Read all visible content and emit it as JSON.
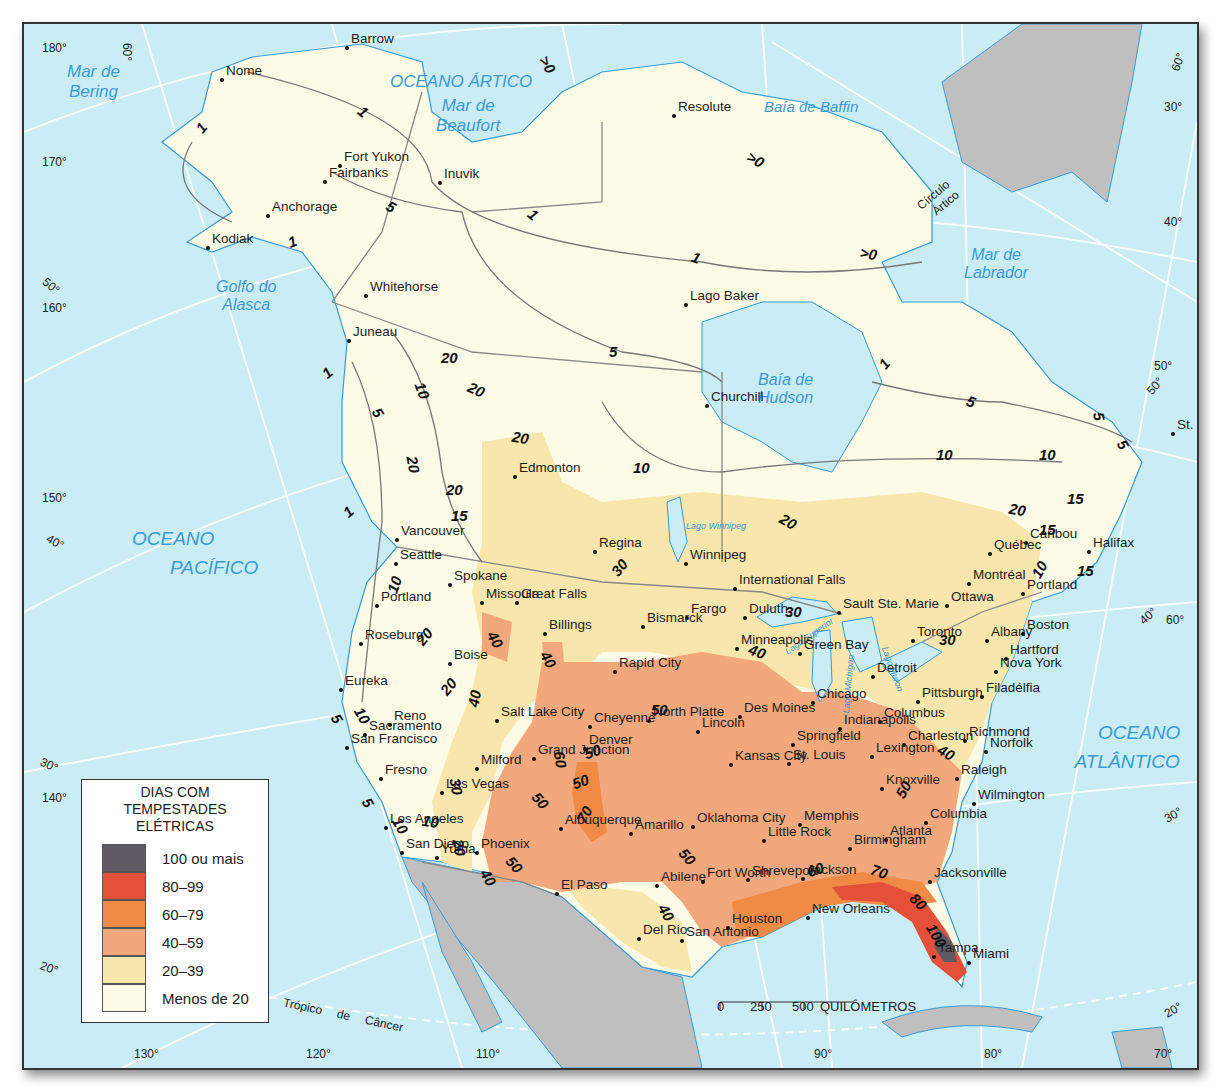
{
  "legend": {
    "title_lines": [
      "DIAS COM",
      "TEMPESTADES",
      "ELÉTRICAS"
    ],
    "classes": [
      {
        "label": "100 ou mais",
        "color": "#5d5a63"
      },
      {
        "label": "80–99",
        "color": "#e5503b"
      },
      {
        "label": "60–79",
        "color": "#f08a44"
      },
      {
        "label": "40–59",
        "color": "#f2a77c"
      },
      {
        "label": "20–39",
        "color": "#f8e6ad"
      },
      {
        "label": "Menos de 20",
        "color": "#fdfbe6"
      }
    ]
  },
  "scale_bar": {
    "ticks": [
      "0",
      "250",
      "500"
    ],
    "unit": "QUILÔMETROS"
  },
  "water_labels": {
    "bering": [
      "Mar de",
      "Bering"
    ],
    "arctic": "OCEANO ÁRTICO",
    "beaufort": [
      "Mar de",
      "Beaufort"
    ],
    "baffin": "Baía de Baffin",
    "labrador": [
      "Mar de",
      "Labrador"
    ],
    "alaska_gulf": [
      "Golfo do",
      "Alasca"
    ],
    "hudson": [
      "Baía de",
      "Hudson"
    ],
    "pacific": [
      "OCEANO",
      "PACÍFICO"
    ],
    "atlantic": [
      "OCEANO",
      "ATLÂNTICO"
    ],
    "lake_winnipeg": "Lago Winnipeg",
    "lake_superior": "Lago Superior",
    "lake_michigan": "Lago Michigan",
    "lake_huron": "Lago Huron"
  },
  "reference_lines": {
    "arctic_circle": [
      "Círculo",
      "Ártico"
    ],
    "tropic": "Trópico de Câncer"
  },
  "graticule": {
    "left": [
      "180°",
      "170°",
      "160°",
      "150°",
      "140°"
    ],
    "left_lat": [
      "60°",
      "50°",
      "40°",
      "30°",
      "20°"
    ],
    "bottom": [
      "130°",
      "120°",
      "110°",
      "90°",
      "80°",
      "70°"
    ],
    "right": [
      "60°",
      "30°",
      "40°",
      "50°",
      "50°",
      "40°",
      "60°",
      "30°",
      "20°"
    ]
  },
  "cities": [
    {
      "name": "Barrow",
      "x": 347,
      "y": 48
    },
    {
      "name": "Nome",
      "x": 222,
      "y": 80
    },
    {
      "name": "Fort Yukon",
      "x": 340,
      "y": 166
    },
    {
      "name": "Fairbanks",
      "x": 325,
      "y": 182
    },
    {
      "name": "Anchorage",
      "x": 268,
      "y": 216
    },
    {
      "name": "Kodiak",
      "x": 208,
      "y": 248
    },
    {
      "name": "Inuvik",
      "x": 440,
      "y": 183
    },
    {
      "name": "Resolute",
      "x": 674,
      "y": 116
    },
    {
      "name": "Whitehorse",
      "x": 366,
      "y": 296
    },
    {
      "name": "Juneau",
      "x": 349,
      "y": 341
    },
    {
      "name": "Lago Baker",
      "x": 686,
      "y": 305
    },
    {
      "name": "Churchill",
      "x": 707,
      "y": 406
    },
    {
      "name": "Edmonton",
      "x": 515,
      "y": 477
    },
    {
      "name": "St. John's",
      "x": 1173,
      "y": 434
    },
    {
      "name": "Vancouver",
      "x": 397,
      "y": 540
    },
    {
      "name": "Seattle",
      "x": 396,
      "y": 564
    },
    {
      "name": "Spokane",
      "x": 450,
      "y": 585
    },
    {
      "name": "Missoula",
      "x": 482,
      "y": 603
    },
    {
      "name": "Great Falls",
      "x": 517,
      "y": 603
    },
    {
      "name": "Regina",
      "x": 595,
      "y": 552
    },
    {
      "name": "Winnipeg",
      "x": 686,
      "y": 564
    },
    {
      "name": "International Falls",
      "x": 735,
      "y": 589
    },
    {
      "name": "Portland",
      "x": 377,
      "y": 606
    },
    {
      "name": "Roseburg",
      "x": 361,
      "y": 644
    },
    {
      "name": "Boise",
      "x": 450,
      "y": 664
    },
    {
      "name": "Billings",
      "x": 545,
      "y": 634
    },
    {
      "name": "Bismarck",
      "x": 643,
      "y": 627
    },
    {
      "name": "Fargo",
      "x": 687,
      "y": 618
    },
    {
      "name": "Duluth",
      "x": 745,
      "y": 618
    },
    {
      "name": "Minneapolis",
      "x": 737,
      "y": 649
    },
    {
      "name": "Green Bay",
      "x": 800,
      "y": 654
    },
    {
      "name": "Sault Ste. Marie",
      "x": 839,
      "y": 613
    },
    {
      "name": "Detroit",
      "x": 873,
      "y": 677
    },
    {
      "name": "Ottawa",
      "x": 947,
      "y": 606
    },
    {
      "name": "Toronto",
      "x": 913,
      "y": 641
    },
    {
      "name": "Albany",
      "x": 987,
      "y": 641
    },
    {
      "name": "Boston",
      "x": 1023,
      "y": 634
    },
    {
      "name": "Québec",
      "x": 990,
      "y": 554
    },
    {
      "name": "Caribou",
      "x": 1026,
      "y": 543
    },
    {
      "name": "Montréal",
      "x": 969,
      "y": 584
    },
    {
      "name": "Portland (ME)",
      "x": 1023,
      "y": 594
    },
    {
      "name": "Halifax",
      "x": 1089,
      "y": 552
    },
    {
      "name": "Hartford",
      "x": 1006,
      "y": 659
    },
    {
      "name": "Nova York",
      "x": 996,
      "y": 672
    },
    {
      "name": "Rapid City",
      "x": 615,
      "y": 672
    },
    {
      "name": "Eureka",
      "x": 341,
      "y": 690
    },
    {
      "name": "Sacramento",
      "x": 365,
      "y": 735
    },
    {
      "name": "San Francisco",
      "x": 347,
      "y": 748
    },
    {
      "name": "Reno",
      "x": 390,
      "y": 725
    },
    {
      "name": "Salt Lake City",
      "x": 497,
      "y": 721
    },
    {
      "name": "Cheyenne",
      "x": 590,
      "y": 727
    },
    {
      "name": "North Platte",
      "x": 649,
      "y": 721
    },
    {
      "name": "Lincoln",
      "x": 698,
      "y": 732
    },
    {
      "name": "Des Moines",
      "x": 740,
      "y": 717
    },
    {
      "name": "Chicago",
      "x": 813,
      "y": 703
    },
    {
      "name": "Indianapolis",
      "x": 840,
      "y": 729
    },
    {
      "name": "Columbus",
      "x": 880,
      "y": 722
    },
    {
      "name": "Pittsburgh",
      "x": 918,
      "y": 702
    },
    {
      "name": "Filadélfia",
      "x": 982,
      "y": 697
    },
    {
      "name": "Richmond",
      "x": 965,
      "y": 741
    },
    {
      "name": "Norfolk",
      "x": 986,
      "y": 752
    },
    {
      "name": "Milford",
      "x": 477,
      "y": 769
    },
    {
      "name": "Denver",
      "x": 585,
      "y": 749
    },
    {
      "name": "Grand Junction",
      "x": 534,
      "y": 759
    },
    {
      "name": "Kansas City",
      "x": 731,
      "y": 765
    },
    {
      "name": "Springfield",
      "x": 793,
      "y": 745
    },
    {
      "name": "St. Louis",
      "x": 789,
      "y": 764
    },
    {
      "name": "Charleston",
      "x": 904,
      "y": 745
    },
    {
      "name": "Lexington",
      "x": 872,
      "y": 757
    },
    {
      "name": "Raleigh",
      "x": 957,
      "y": 779
    },
    {
      "name": "Fresno",
      "x": 381,
      "y": 779
    },
    {
      "name": "Las Vegas",
      "x": 442,
      "y": 793
    },
    {
      "name": "Knoxville",
      "x": 882,
      "y": 789
    },
    {
      "name": "Wilmington",
      "x": 974,
      "y": 804
    },
    {
      "name": "Albuquerque",
      "x": 561,
      "y": 829
    },
    {
      "name": "Oklahoma City",
      "x": 693,
      "y": 827
    },
    {
      "name": "Little Rock",
      "x": 764,
      "y": 841
    },
    {
      "name": "Memphis",
      "x": 800,
      "y": 825
    },
    {
      "name": "Atlanta",
      "x": 886,
      "y": 840
    },
    {
      "name": "Columbia",
      "x": 926,
      "y": 823
    },
    {
      "name": "Los Angeles",
      "x": 386,
      "y": 828
    },
    {
      "name": "San Diego",
      "x": 402,
      "y": 853
    },
    {
      "name": "Yuma",
      "x": 437,
      "y": 858
    },
    {
      "name": "Phoenix",
      "x": 477,
      "y": 853
    },
    {
      "name": "Amarillo",
      "x": 631,
      "y": 834
    },
    {
      "name": "Birmingham",
      "x": 850,
      "y": 849
    },
    {
      "name": "Jackson",
      "x": 803,
      "y": 879
    },
    {
      "name": "Shreveport",
      "x": 748,
      "y": 880
    },
    {
      "name": "Abilene",
      "x": 657,
      "y": 886
    },
    {
      "name": "Fort Worth",
      "x": 703,
      "y": 882
    },
    {
      "name": "Jacksonville",
      "x": 930,
      "y": 882
    },
    {
      "name": "El Paso",
      "x": 557,
      "y": 894
    },
    {
      "name": "New Orleans",
      "x": 808,
      "y": 918
    },
    {
      "name": "Houston",
      "x": 728,
      "y": 928
    },
    {
      "name": "Del Rio",
      "x": 639,
      "y": 939
    },
    {
      "name": "San Antonio",
      "x": 682,
      "y": 941
    },
    {
      "name": "Tampa",
      "x": 934,
      "y": 957
    },
    {
      "name": "Miami",
      "x": 969,
      "y": 963
    }
  ],
  "isolines": [
    {
      "value": "1",
      "x": 205,
      "y": 128,
      "rot": -50
    },
    {
      "value": "1",
      "x": 367,
      "y": 112,
      "rot": 40
    },
    {
      "value": "5",
      "x": 395,
      "y": 207,
      "rot": 30
    },
    {
      "value": "1",
      "x": 296,
      "y": 242,
      "rot": -20
    },
    {
      "value": "1",
      "x": 537,
      "y": 215,
      "rot": 40
    },
    {
      "value": ">0",
      "x": 547,
      "y": 65,
      "rot": 60
    },
    {
      "value": ">0",
      "x": 755,
      "y": 160,
      "rot": 30
    },
    {
      "value": ">0",
      "x": 868,
      "y": 254,
      "rot": 10
    },
    {
      "value": "1",
      "x": 700,
      "y": 258,
      "rot": 20
    },
    {
      "value": "5",
      "x": 617,
      "y": 352,
      "rot": 0
    },
    {
      "value": "20",
      "x": 449,
      "y": 358,
      "rot": 0
    },
    {
      "value": "20",
      "x": 476,
      "y": 390,
      "rot": 25
    },
    {
      "value": "10",
      "x": 422,
      "y": 391,
      "rot": 70
    },
    {
      "value": "5",
      "x": 382,
      "y": 413,
      "rot": 60
    },
    {
      "value": "1",
      "x": 331,
      "y": 373,
      "rot": -40
    },
    {
      "value": "20",
      "x": 520,
      "y": 438,
      "rot": 10
    },
    {
      "value": "20",
      "x": 413,
      "y": 465,
      "rot": 80
    },
    {
      "value": "20",
      "x": 454,
      "y": 490,
      "rot": 0
    },
    {
      "value": "15",
      "x": 459,
      "y": 516,
      "rot": 0
    },
    {
      "value": "10",
      "x": 641,
      "y": 468,
      "rot": 0
    },
    {
      "value": "1",
      "x": 888,
      "y": 364,
      "rot": -50
    },
    {
      "value": "5",
      "x": 975,
      "y": 402,
      "rot": 20
    },
    {
      "value": "10",
      "x": 944,
      "y": 455,
      "rot": 0
    },
    {
      "value": "10",
      "x": 1047,
      "y": 455,
      "rot": 0
    },
    {
      "value": "5",
      "x": 1103,
      "y": 417,
      "rot": 80
    },
    {
      "value": "5",
      "x": 1127,
      "y": 445,
      "rot": 60
    },
    {
      "value": "15",
      "x": 1075,
      "y": 499,
      "rot": 0
    },
    {
      "value": "20",
      "x": 1017,
      "y": 510,
      "rot": 10
    },
    {
      "value": "15",
      "x": 1047,
      "y": 530,
      "rot": 0
    },
    {
      "value": "15",
      "x": 1085,
      "y": 571,
      "rot": 0
    },
    {
      "value": "10",
      "x": 1039,
      "y": 570,
      "rot": -60
    },
    {
      "value": "20",
      "x": 788,
      "y": 522,
      "rot": 30
    },
    {
      "value": "30",
      "x": 619,
      "y": 568,
      "rot": -50
    },
    {
      "value": "1",
      "x": 352,
      "y": 512,
      "rot": -40
    },
    {
      "value": "10",
      "x": 394,
      "y": 585,
      "rot": -70
    },
    {
      "value": "30",
      "x": 793,
      "y": 612,
      "rot": 0
    },
    {
      "value": "30",
      "x": 947,
      "y": 640,
      "rot": 0
    },
    {
      "value": "40",
      "x": 757,
      "y": 652,
      "rot": 20
    },
    {
      "value": "20",
      "x": 424,
      "y": 637,
      "rot": -50
    },
    {
      "value": "40",
      "x": 495,
      "y": 640,
      "rot": 60
    },
    {
      "value": "40",
      "x": 548,
      "y": 660,
      "rot": 60
    },
    {
      "value": "20",
      "x": 448,
      "y": 687,
      "rot": -50
    },
    {
      "value": "40",
      "x": 474,
      "y": 699,
      "rot": -80
    },
    {
      "value": "50",
      "x": 659,
      "y": 710,
      "rot": 0
    },
    {
      "value": "5",
      "x": 341,
      "y": 719,
      "rot": 60
    },
    {
      "value": "10",
      "x": 362,
      "y": 716,
      "rot": 60
    },
    {
      "value": "40",
      "x": 946,
      "y": 753,
      "rot": 30
    },
    {
      "value": "60",
      "x": 560,
      "y": 760,
      "rot": 80
    },
    {
      "value": "50",
      "x": 592,
      "y": 752,
      "rot": -20
    },
    {
      "value": "50",
      "x": 580,
      "y": 782,
      "rot": -20
    },
    {
      "value": "30",
      "x": 456,
      "y": 787,
      "rot": 80
    },
    {
      "value": "50",
      "x": 540,
      "y": 801,
      "rot": 50
    },
    {
      "value": "70",
      "x": 584,
      "y": 815,
      "rot": -60
    },
    {
      "value": "50",
      "x": 903,
      "y": 790,
      "rot": -60
    },
    {
      "value": "5",
      "x": 372,
      "y": 803,
      "rot": 60
    },
    {
      "value": "10",
      "x": 400,
      "y": 826,
      "rot": 60
    },
    {
      "value": "10",
      "x": 430,
      "y": 822,
      "rot": 10
    },
    {
      "value": "20",
      "x": 459,
      "y": 848,
      "rot": 80
    },
    {
      "value": "50",
      "x": 514,
      "y": 865,
      "rot": 50
    },
    {
      "value": "50",
      "x": 687,
      "y": 857,
      "rot": 50
    },
    {
      "value": "40",
      "x": 488,
      "y": 878,
      "rot": 60
    },
    {
      "value": "60",
      "x": 815,
      "y": 870,
      "rot": -20
    },
    {
      "value": "70",
      "x": 879,
      "y": 872,
      "rot": 20
    },
    {
      "value": "40",
      "x": 666,
      "y": 913,
      "rot": 60
    },
    {
      "value": "80",
      "x": 918,
      "y": 902,
      "rot": 45
    },
    {
      "value": "100",
      "x": 932,
      "y": 936,
      "rot": 60
    }
  ]
}
